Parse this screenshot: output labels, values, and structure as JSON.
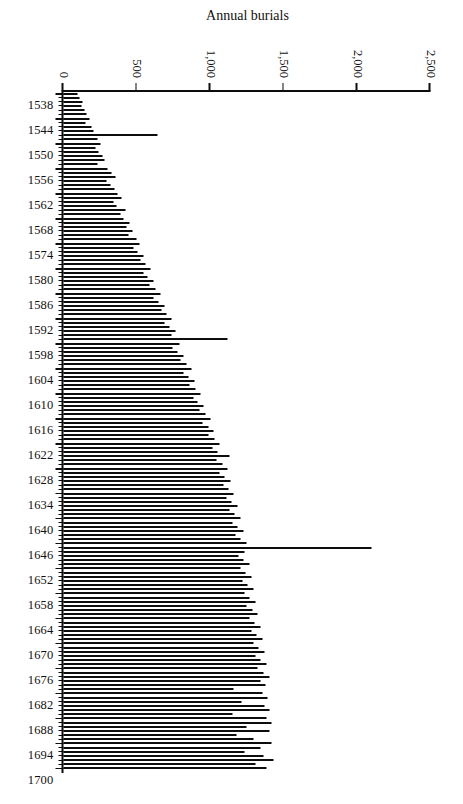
{
  "chart_data": {
    "type": "bar",
    "title": "",
    "xlabel": "",
    "ylabel": "Annual burials",
    "orientation": "page-rotated-90-clockwise",
    "grid": false,
    "legend": null,
    "ylim": [
      0,
      2500
    ],
    "ytick_labels": [
      "0",
      "500",
      "1,000",
      "1,500",
      "2,000",
      "2,500"
    ],
    "ytick_values": [
      0,
      500,
      1000,
      1500,
      2000,
      2500
    ],
    "xtick_labels": [
      "1538",
      "1544",
      "1550",
      "1556",
      "1562",
      "1568",
      "1574",
      "1580",
      "1586",
      "1592",
      "1598",
      "1604",
      "1610",
      "1616",
      "1622",
      "1628",
      "1634",
      "1640",
      "1646",
      "1652",
      "1658",
      "1664",
      "1670",
      "1676",
      "1682",
      "1688",
      "1694",
      "1700"
    ],
    "xtick_values": [
      1538,
      1544,
      1550,
      1556,
      1562,
      1568,
      1574,
      1580,
      1586,
      1592,
      1598,
      1604,
      1610,
      1616,
      1622,
      1628,
      1634,
      1640,
      1646,
      1652,
      1658,
      1664,
      1670,
      1676,
      1682,
      1688,
      1694,
      1700
    ],
    "xlim": [
      1538,
      1700
    ],
    "bar_color": "#0d0d0d",
    "annotations": [],
    "categories": [
      1538,
      1539,
      1540,
      1541,
      1542,
      1543,
      1544,
      1545,
      1546,
      1547,
      1548,
      1549,
      1550,
      1551,
      1552,
      1553,
      1554,
      1555,
      1556,
      1557,
      1558,
      1559,
      1560,
      1561,
      1562,
      1563,
      1564,
      1565,
      1566,
      1567,
      1568,
      1569,
      1570,
      1571,
      1572,
      1573,
      1574,
      1575,
      1576,
      1577,
      1578,
      1579,
      1580,
      1581,
      1582,
      1583,
      1584,
      1585,
      1586,
      1587,
      1588,
      1589,
      1590,
      1591,
      1592,
      1593,
      1594,
      1595,
      1596,
      1597,
      1598,
      1599,
      1600,
      1601,
      1602,
      1603,
      1604,
      1605,
      1606,
      1607,
      1608,
      1609,
      1610,
      1611,
      1612,
      1613,
      1614,
      1615,
      1616,
      1617,
      1618,
      1619,
      1620,
      1621,
      1622,
      1623,
      1624,
      1625,
      1626,
      1627,
      1628,
      1629,
      1630,
      1631,
      1632,
      1633,
      1634,
      1635,
      1636,
      1637,
      1638,
      1639,
      1640,
      1641,
      1642,
      1643,
      1644,
      1645,
      1646,
      1647,
      1648,
      1649,
      1650,
      1651,
      1652,
      1653,
      1654,
      1655,
      1656,
      1657,
      1658,
      1659,
      1660,
      1661,
      1662,
      1663,
      1664,
      1665,
      1666,
      1667,
      1668,
      1669,
      1670,
      1671,
      1672,
      1673,
      1674,
      1675,
      1676,
      1677,
      1678,
      1679,
      1680,
      1681,
      1682,
      1683,
      1684,
      1685,
      1686,
      1687,
      1688,
      1689,
      1690,
      1691,
      1692,
      1693,
      1694,
      1695,
      1696,
      1697,
      1698,
      1699,
      1700
    ],
    "values": [
      95,
      110,
      130,
      120,
      145,
      160,
      175,
      150,
      190,
      205,
      640,
      230,
      250,
      215,
      240,
      265,
      280,
      230,
      300,
      330,
      355,
      290,
      320,
      345,
      370,
      395,
      340,
      360,
      420,
      385,
      410,
      450,
      430,
      470,
      440,
      495,
      520,
      480,
      505,
      545,
      525,
      560,
      590,
      545,
      575,
      610,
      585,
      630,
      660,
      615,
      645,
      690,
      665,
      700,
      735,
      690,
      720,
      760,
      735,
      1115,
      790,
      745,
      775,
      820,
      795,
      840,
      870,
      820,
      855,
      890,
      860,
      900,
      935,
      885,
      915,
      955,
      925,
      965,
      1000,
      950,
      985,
      1020,
      990,
      1030,
      1065,
      1015,
      1050,
      1130,
      1045,
      1080,
      1115,
      1065,
      1100,
      1140,
      1090,
      1125,
      1160,
      1110,
      1145,
      1185,
      1130,
      1165,
      1205,
      1150,
      1185,
      1225,
      1170,
      1205,
      1245,
      2100,
      1230,
      1190,
      1225,
      1265,
      1205,
      1240,
      1280,
      1220,
      1255,
      1295,
      1235,
      1270,
      1310,
      1250,
      1285,
      1325,
      1265,
      1300,
      1340,
      1280,
      1315,
      1355,
      1295,
      1330,
      1370,
      1310,
      1345,
      1385,
      1325,
      1360,
      1400,
      1340,
      1375,
      1160,
      1355,
      1390,
      1215,
      1370,
      1405,
      1150,
      1385,
      1420,
      1245,
      1400,
      1180,
      1295,
      1415,
      1340,
      1230,
      1360,
      1430,
      1305,
      1385
    ]
  }
}
